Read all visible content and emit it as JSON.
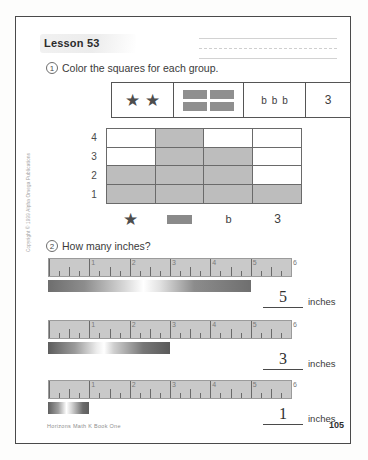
{
  "page": {
    "lesson_title": "Lesson 53",
    "footer_source": "Horizons Math K Book One",
    "page_number": "105",
    "side_copyright": "Copyright © 1999 Alpha Omega Publications"
  },
  "question1": {
    "number": "1",
    "prompt": "Color the squares for each group.",
    "group_box": {
      "cells": [
        {
          "kind": "stars",
          "count": 2,
          "glyph": "★"
        },
        {
          "kind": "rectangles",
          "count": 4
        },
        {
          "kind": "letters",
          "value": "b",
          "count": 3
        },
        {
          "kind": "digit",
          "value": "3"
        }
      ]
    },
    "graph": {
      "y_labels": [
        "4",
        "3",
        "2",
        "1"
      ],
      "categories": [
        "star",
        "rectangle",
        "b",
        "3"
      ],
      "legend_labels": [
        "★",
        "",
        "b",
        "3"
      ],
      "values": [
        2,
        4,
        3,
        1
      ],
      "fill_color": "#bdbdbd"
    }
  },
  "question2": {
    "number": "2",
    "prompt": "How many inches?",
    "ruler": {
      "numbers": [
        "1",
        "2",
        "3",
        "4",
        "5",
        "6"
      ],
      "max_inches": 6,
      "unit": "inches"
    },
    "items": [
      {
        "bar_inches": 5,
        "answer": "5",
        "unit": "inches"
      },
      {
        "bar_inches": 3,
        "answer": "3",
        "unit": "inches"
      },
      {
        "bar_inches": 1,
        "answer": "1",
        "unit": "inches"
      }
    ]
  },
  "chart_data": {
    "type": "bar",
    "title": "Color the squares for each group.",
    "categories": [
      "star",
      "rectangle",
      "b",
      "3"
    ],
    "values": [
      2,
      4,
      3,
      1
    ],
    "ylabel": "",
    "xlabel": "",
    "ylim": [
      0,
      4
    ],
    "ytick_labels": [
      "1",
      "2",
      "3",
      "4"
    ],
    "grid": true,
    "legend": "none"
  }
}
